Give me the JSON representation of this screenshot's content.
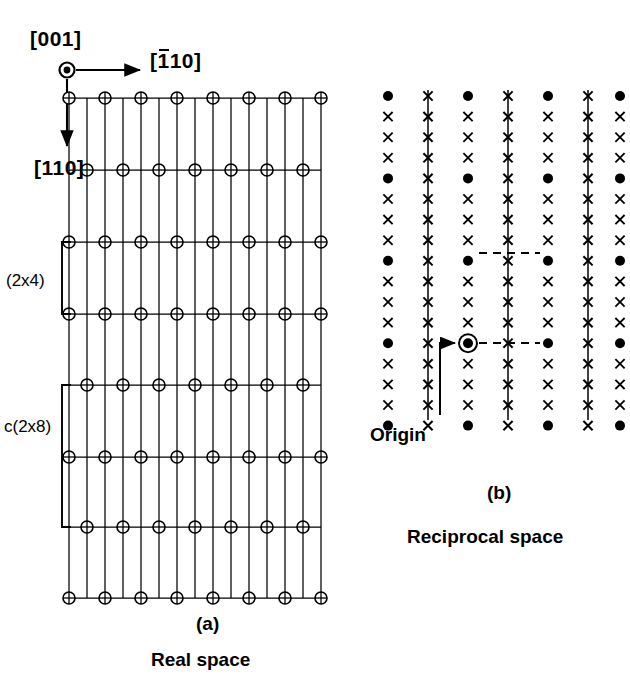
{
  "figure": {
    "panels": [
      {
        "id": "a",
        "panel_label": "(a)",
        "caption": "Real space",
        "reconstruction_labels": [
          "(2x4)",
          "c(2x8)"
        ]
      },
      {
        "id": "b",
        "panel_label": "(b)",
        "caption": "Reciprocal space",
        "origin_label": "Origin"
      }
    ],
    "directions": {
      "out_of_plane": "[001]",
      "horizontal_prefix": "[",
      "horizontal_first": "1",
      "horizontal_rest": "10]",
      "horizontal_full": "[110]",
      "horizontal_overbar_on": "1",
      "vertical": "[110]"
    },
    "colors": {
      "ink": "#000000",
      "background": "#ffffff"
    }
  },
  "chart_data": {
    "type": "scatter",
    "panels": [
      {
        "name": "Real space",
        "label": "(a)",
        "xlabel": "[110]",
        "ylabel": "[110]",
        "lattice": {
          "n_vertical_lines": 15,
          "vertical_line_x": [
            69,
            87,
            105,
            123,
            141,
            159,
            177,
            195,
            213,
            231,
            249,
            267,
            285,
            303,
            321
          ],
          "x_left": 69,
          "x_right": 321,
          "y_top": 98,
          "y_bottom": 598,
          "rows": [
            {
              "y": 98,
              "phase": "even",
              "circle_x": [
                69,
                105,
                141,
                177,
                213,
                249,
                285,
                321
              ],
              "count": 8
            },
            {
              "y": 170,
              "phase": "odd",
              "circle_x": [
                87,
                123,
                159,
                195,
                231,
                267,
                303
              ],
              "count": 7
            },
            {
              "y": 242,
              "phase": "even",
              "circle_x": [
                69,
                105,
                141,
                177,
                213,
                249,
                285,
                321
              ],
              "count": 8
            },
            {
              "y": 314,
              "phase": "even",
              "circle_x": [
                69,
                105,
                141,
                177,
                213,
                249,
                285,
                321
              ],
              "count": 8
            },
            {
              "y": 385,
              "phase": "odd",
              "circle_x": [
                87,
                123,
                159,
                195,
                231,
                267,
                303
              ],
              "count": 7
            },
            {
              "y": 457,
              "phase": "even",
              "circle_x": [
                69,
                105,
                141,
                177,
                213,
                249,
                285,
                321
              ],
              "count": 8
            },
            {
              "y": 527,
              "phase": "odd",
              "circle_x": [
                87,
                123,
                159,
                195,
                231,
                267,
                303
              ],
              "count": 7
            },
            {
              "y": 598,
              "phase": "even",
              "circle_x": [
                69,
                105,
                141,
                177,
                213,
                249,
                285,
                321
              ],
              "count": 8
            }
          ],
          "marker": "circle-with-cross",
          "circle_radius": 6
        },
        "brackets": [
          {
            "label": "(2x4)",
            "y_top": 242,
            "y_bottom": 314,
            "x": 62
          },
          {
            "label": "c(2x8)",
            "y_top": 385,
            "y_bottom": 527,
            "x": 62
          }
        ]
      },
      {
        "name": "Reciprocal space",
        "label": "(b)",
        "lattice": {
          "n_columns": 7,
          "column_x": [
            388,
            428,
            468,
            508,
            548,
            588,
            620
          ],
          "column_types": [
            "dots",
            "line",
            "dots",
            "line",
            "dots",
            "line",
            "dots"
          ],
          "n_rows": 17,
          "row_y_start": 96,
          "row_spacing": 20.6,
          "dot_row_interval": 4,
          "dot_rows": [
            0,
            4,
            8,
            12,
            16
          ],
          "markers": {
            "dot": "filled-circle",
            "cross": "x-cross"
          },
          "line_column_line": {
            "y_top": 90,
            "y_bottom": 420
          },
          "origin": {
            "column_index": 2,
            "row_index": 12,
            "x": 468,
            "y": 343,
            "marker": "circled-filled-dot"
          },
          "dashed_connections": [
            {
              "y": 253,
              "x_from": 468,
              "x_to": 548
            },
            {
              "y": 343,
              "x_from": 468,
              "x_to": 548
            }
          ],
          "origin_arrow": {
            "from_x": 440,
            "from_y": 415,
            "to_x": 455,
            "to_y": 343
          }
        }
      }
    ]
  }
}
